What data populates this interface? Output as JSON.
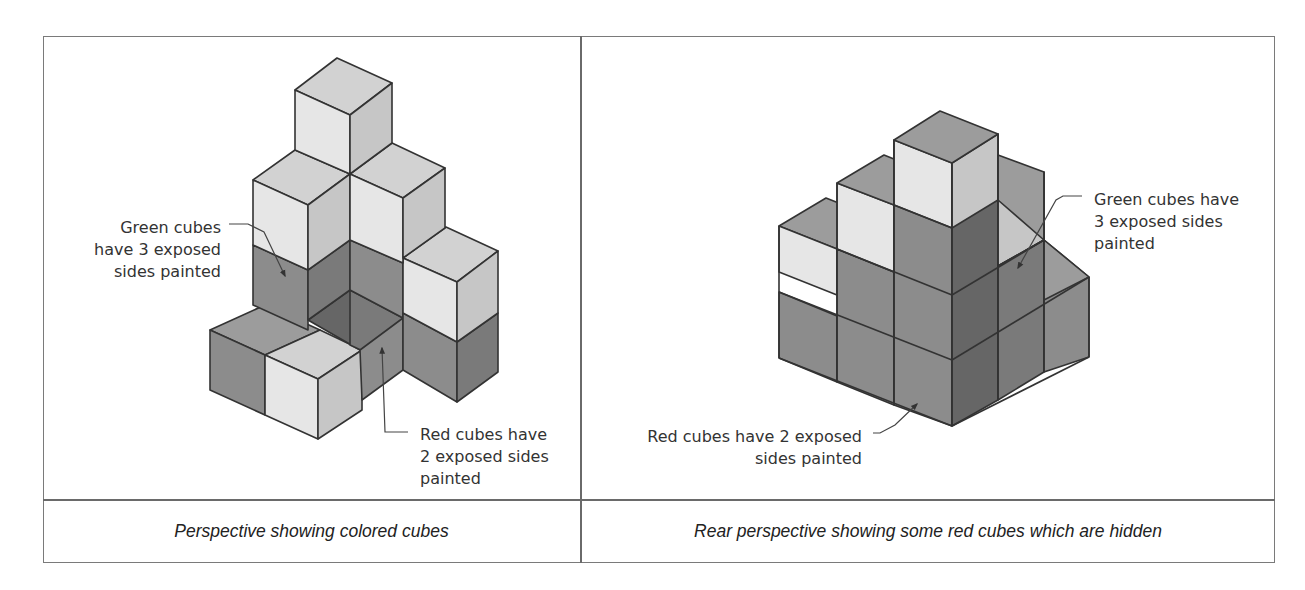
{
  "colors": {
    "light_front": "#e6e6e6",
    "light_top": "#d2d2d2",
    "light_side": "#c6c6c6",
    "dark_front": "#8c8c8c",
    "dark_top": "#9c9c9c",
    "dark_side": "#7a7a7a",
    "darkest": "#666666",
    "edge": "#333333",
    "table_border": "#7a7a7a"
  },
  "left_panel": {
    "caption": "Perspective showing colored cubes",
    "labels": {
      "green": [
        "Green cubes",
        "have 3 exposed",
        "sides painted"
      ],
      "red": [
        "Red cubes have",
        "2 exposed sides",
        "painted"
      ]
    }
  },
  "right_panel": {
    "caption": "Rear perspective showing some red cubes which are hidden",
    "labels": {
      "green": [
        "Green cubes have",
        "3 exposed sides",
        "painted"
      ],
      "red": [
        "Red cubes have 2 exposed",
        "sides painted"
      ]
    }
  },
  "figures": {
    "left": [
      {
        "pts": "210,330 265,305 320,330 265,355",
        "c": "dark_top"
      },
      {
        "pts": "210,330 265,355 265,415 210,390",
        "c": "dark_front"
      },
      {
        "pts": "265,355 320,330 362,350 318,379",
        "c": "light_top"
      },
      {
        "pts": "265,355 318,379 318,439 265,415",
        "c": "light_front"
      },
      {
        "pts": "318,379 362,350 362,410 318,439",
        "c": "light_side"
      },
      {
        "pts": "308,320 350,290 403,318 360,350",
        "c": "darkest"
      },
      {
        "pts": "350,290 403,318 403,370 350,345",
        "c": "dark_side"
      },
      {
        "pts": "360,350 403,318 403,370 362,400",
        "c": "dark_front"
      },
      {
        "pts": "253,245 308,270 308,330 253,305",
        "c": "dark_front"
      },
      {
        "pts": "308,270 350,240 350,290 308,320",
        "c": "dark_side"
      },
      {
        "pts": "350,240 403,263 403,318 350,290",
        "c": "dark_front"
      },
      {
        "pts": "403,313 457,342 457,402 403,370",
        "c": "dark_front"
      },
      {
        "pts": "457,342 498,313 498,372 457,402",
        "c": "dark_side"
      },
      {
        "pts": "403,258 446,227 498,251 457,282",
        "c": "light_top"
      },
      {
        "pts": "403,258 457,282 457,342 403,313",
        "c": "light_front"
      },
      {
        "pts": "457,282 498,251 498,313 457,342",
        "c": "light_side"
      },
      {
        "pts": "253,180 295,150 350,174 308,205",
        "c": "light_top"
      },
      {
        "pts": "253,180 308,205 308,270 253,245",
        "c": "light_front"
      },
      {
        "pts": "308,205 350,174 350,240 308,270",
        "c": "light_side"
      },
      {
        "pts": "350,174 392,143 445,168 403,198",
        "c": "light_top"
      },
      {
        "pts": "350,174 403,198 403,263 350,240",
        "c": "light_front"
      },
      {
        "pts": "403,198 445,168 445,228 403,258",
        "c": "light_side"
      },
      {
        "pts": "295,90 337,58 392,83 350,115",
        "c": "light_top"
      },
      {
        "pts": "295,90 350,115 350,174 295,150",
        "c": "light_front"
      },
      {
        "pts": "350,115 392,83 392,143 350,174",
        "c": "light_side"
      }
    ],
    "right": [
      {
        "pts": "779,226 826,198 884,221 837,249",
        "c": "dark_top"
      },
      {
        "pts": "779,226 837,249 837,295 779,272",
        "c": "light_front"
      },
      {
        "pts": "779,292 837,316 837,382 779,358",
        "c": "dark_front"
      },
      {
        "pts": "837,249 837,382 894,405 894,272",
        "c": "dark_front"
      },
      {
        "pts": "837,249 894,272 894,205 837,183",
        "c": "light_front"
      },
      {
        "pts": "837,183 884,155 941,178 894,205",
        "c": "dark_top"
      },
      {
        "pts": "894,140 952,163 952,426 894,405",
        "c": "dark_front"
      },
      {
        "pts": "894,140 952,163 952,228 894,205",
        "c": "light_front"
      },
      {
        "pts": "952,163 998,134 998,400 952,426",
        "c": "darkest"
      },
      {
        "pts": "952,163 998,134 998,200 952,228",
        "c": "light_side"
      },
      {
        "pts": "998,200 1044,172 1044,240 998,266",
        "c": "light_side"
      },
      {
        "pts": "998,155 1044,172 1044,240 998,200",
        "c": "dark_top"
      },
      {
        "pts": "998,266 1044,240 1044,372 998,400",
        "c": "dark_side"
      },
      {
        "pts": "1044,240 1044,372 1089,357 1089,277",
        "c": "dark_front"
      },
      {
        "pts": "1044,240 1089,277 1044,300",
        "c": "dark_top"
      },
      {
        "pts": "894,140 940,111 998,134 952,163",
        "c": "dark_top"
      }
    ],
    "right_lines": [
      "779,292 952,360",
      "837,249 952,295",
      "952,360 1089,277",
      "952,295 1044,240",
      "779,358 952,426",
      "952,426 1089,357",
      "894,205 952,228",
      "998,266 1044,240",
      "837,183 837,382",
      "894,140 894,405",
      "952,163 952,426",
      "998,134 998,400",
      "1044,172 1044,372",
      "1089,277 1089,357",
      "779,226 779,358"
    ],
    "leaders": {
      "left_green": "229,224 248,224 264,232 285,276",
      "left_red": "408,432 385,432 382,348",
      "right_green": "1082,196 1063,196 1056,200 1018,268",
      "right_red": "873,433 880,433 895,425 917,404"
    }
  }
}
